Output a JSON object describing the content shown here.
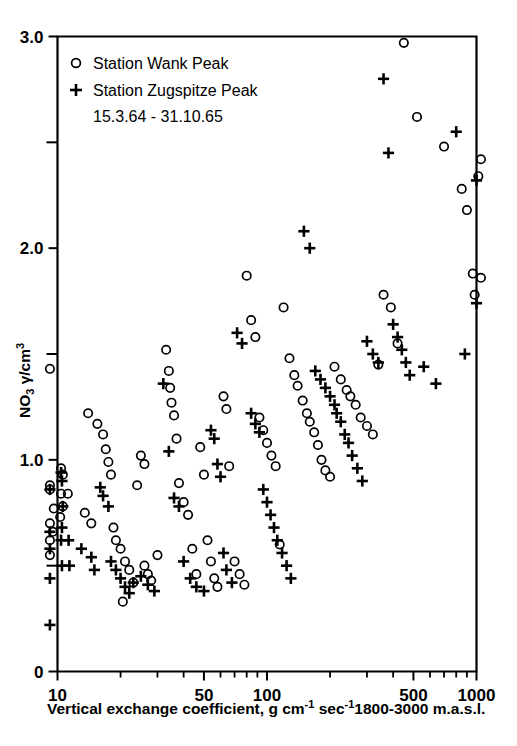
{
  "figure": {
    "background_color": "#ffffff",
    "ink_color": "#000000"
  },
  "chart_data": {
    "type": "scatter",
    "title": "",
    "xlabel": "Vertical exchange coefficient, g cm⁻¹ sec⁻¹ 1800-3000 m.a.s.l.",
    "ylabel": "NO₃ γ/cm³",
    "xscale": "log",
    "yscale": "linear",
    "xlim": [
      9.0,
      1150
    ],
    "ylim": [
      0,
      3.0
    ],
    "grid": false,
    "legend_position": "top-left",
    "xticks": [
      10,
      50,
      100,
      500,
      1000
    ],
    "xtick_labels": [
      "10",
      "50",
      "100",
      "500",
      "1000"
    ],
    "xticks_minor": [
      20,
      30,
      40,
      60,
      70,
      80,
      90,
      200,
      300,
      400,
      600,
      700,
      800,
      900
    ],
    "yticks": [
      0,
      1.0,
      2.0,
      3.0
    ],
    "ytick_labels": [
      "0",
      "1.0",
      "2.0",
      "3.0"
    ],
    "yticks_minor": [
      0.5,
      1.5,
      2.5
    ],
    "annotation": "15.3.64 - 31.10.65",
    "series": [
      {
        "name": "Station Wank Peak",
        "marker": "circle",
        "legend_label": "Station Wank Peak",
        "points": [
          [
            9.2,
            1.43
          ],
          [
            9.2,
            0.88
          ],
          [
            9.2,
            0.86
          ],
          [
            9.2,
            0.7
          ],
          [
            9.2,
            0.62
          ],
          [
            9.2,
            0.55
          ],
          [
            10.4,
            0.96
          ],
          [
            10.6,
            0.93
          ],
          [
            10.4,
            0.84
          ],
          [
            11.2,
            0.84
          ],
          [
            10.6,
            0.78
          ],
          [
            10.3,
            0.73
          ],
          [
            9.6,
            0.77
          ],
          [
            9.5,
            0.66
          ],
          [
            13.5,
            0.75
          ],
          [
            14.0,
            1.22
          ],
          [
            14.5,
            0.7
          ],
          [
            15.5,
            1.17
          ],
          [
            16.5,
            1.12
          ],
          [
            17.0,
            1.05
          ],
          [
            17.5,
            0.99
          ],
          [
            18.0,
            0.93
          ],
          [
            18.5,
            0.68
          ],
          [
            19.0,
            0.62
          ],
          [
            20.0,
            0.58
          ],
          [
            21.0,
            0.52
          ],
          [
            22.0,
            0.48
          ],
          [
            23.0,
            0.42
          ],
          [
            20.5,
            0.33
          ],
          [
            26.0,
            0.5
          ],
          [
            27.0,
            0.46
          ],
          [
            28.0,
            0.43
          ],
          [
            30.0,
            0.55
          ],
          [
            24.0,
            0.88
          ],
          [
            25.0,
            1.02
          ],
          [
            26.0,
            0.98
          ],
          [
            33.0,
            1.52
          ],
          [
            34.0,
            1.42
          ],
          [
            34.5,
            1.34
          ],
          [
            35.0,
            1.27
          ],
          [
            36.0,
            1.21
          ],
          [
            37.0,
            1.1
          ],
          [
            38.0,
            0.89
          ],
          [
            40.0,
            0.8
          ],
          [
            42.0,
            0.74
          ],
          [
            44.0,
            0.58
          ],
          [
            46.0,
            0.46
          ],
          [
            48.0,
            1.06
          ],
          [
            50.0,
            0.93
          ],
          [
            52.0,
            0.62
          ],
          [
            54.0,
            0.52
          ],
          [
            56.0,
            0.44
          ],
          [
            58.0,
            0.4
          ],
          [
            62.0,
            1.3
          ],
          [
            64.0,
            1.24
          ],
          [
            66.0,
            0.97
          ],
          [
            70.0,
            0.52
          ],
          [
            74.0,
            0.46
          ],
          [
            78.0,
            0.41
          ],
          [
            80.0,
            1.87
          ],
          [
            84.0,
            1.66
          ],
          [
            88.0,
            1.58
          ],
          [
            92.0,
            1.2
          ],
          [
            96.0,
            1.14
          ],
          [
            100.0,
            1.08
          ],
          [
            105.0,
            1.02
          ],
          [
            110.0,
            0.97
          ],
          [
            115.0,
            0.6
          ],
          [
            120.0,
            1.72
          ],
          [
            128.0,
            1.48
          ],
          [
            135.0,
            1.4
          ],
          [
            140.0,
            1.35
          ],
          [
            148.0,
            1.28
          ],
          [
            155.0,
            1.22
          ],
          [
            160.0,
            1.18
          ],
          [
            168.0,
            1.13
          ],
          [
            175.0,
            1.07
          ],
          [
            182.0,
            1.0
          ],
          [
            190.0,
            0.95
          ],
          [
            200.0,
            0.92
          ],
          [
            210.0,
            1.44
          ],
          [
            225.0,
            1.38
          ],
          [
            240.0,
            1.33
          ],
          [
            250.0,
            1.3
          ],
          [
            265.0,
            1.26
          ],
          [
            280.0,
            1.2
          ],
          [
            300.0,
            1.16
          ],
          [
            320.0,
            1.12
          ],
          [
            340.0,
            1.45
          ],
          [
            360.0,
            1.78
          ],
          [
            390.0,
            1.72
          ],
          [
            420.0,
            1.55
          ],
          [
            450.0,
            2.97
          ],
          [
            520.0,
            2.62
          ],
          [
            700.0,
            2.48
          ],
          [
            850.0,
            2.28
          ],
          [
            900.0,
            2.18
          ],
          [
            960.0,
            1.88
          ],
          [
            980.0,
            1.78
          ],
          [
            1050.0,
            2.42
          ],
          [
            1050.0,
            1.86
          ],
          [
            1020.0,
            2.34
          ]
        ]
      },
      {
        "name": "Station Zugspitze Peak",
        "marker": "plus",
        "legend_label": "Station Zugspitze Peak",
        "points": [
          [
            9.2,
            0.86
          ],
          [
            9.2,
            0.66
          ],
          [
            9.2,
            0.58
          ],
          [
            9.2,
            0.44
          ],
          [
            9.2,
            0.22
          ],
          [
            10.4,
            0.94
          ],
          [
            10.5,
            0.9
          ],
          [
            10.6,
            0.78
          ],
          [
            10.5,
            0.68
          ],
          [
            10.4,
            0.62
          ],
          [
            11.3,
            0.62
          ],
          [
            10.5,
            0.5
          ],
          [
            11.4,
            0.5
          ],
          [
            13.0,
            0.58
          ],
          [
            14.5,
            0.54
          ],
          [
            15.0,
            0.48
          ],
          [
            16.0,
            0.87
          ],
          [
            16.5,
            0.83
          ],
          [
            17.5,
            0.78
          ],
          [
            18.0,
            0.52
          ],
          [
            19.0,
            0.48
          ],
          [
            20.0,
            0.44
          ],
          [
            21.0,
            0.4
          ],
          [
            22.0,
            0.37
          ],
          [
            23.0,
            0.42
          ],
          [
            25.0,
            0.45
          ],
          [
            27.0,
            0.41
          ],
          [
            29.0,
            0.38
          ],
          [
            32.0,
            1.36
          ],
          [
            34.0,
            1.04
          ],
          [
            36.0,
            0.82
          ],
          [
            38.0,
            0.78
          ],
          [
            40.0,
            0.52
          ],
          [
            43.0,
            0.44
          ],
          [
            46.0,
            0.4
          ],
          [
            50.0,
            0.38
          ],
          [
            54.0,
            1.14
          ],
          [
            56.0,
            1.1
          ],
          [
            58.0,
            0.98
          ],
          [
            60.0,
            0.92
          ],
          [
            62.0,
            0.56
          ],
          [
            64.0,
            0.48
          ],
          [
            68.0,
            0.42
          ],
          [
            72.0,
            1.6
          ],
          [
            76.0,
            1.55
          ],
          [
            84.0,
            1.22
          ],
          [
            88.0,
            1.17
          ],
          [
            92.0,
            1.13
          ],
          [
            96.0,
            0.86
          ],
          [
            100.0,
            0.8
          ],
          [
            104.0,
            0.74
          ],
          [
            108.0,
            0.68
          ],
          [
            112.0,
            0.62
          ],
          [
            118.0,
            0.56
          ],
          [
            124.0,
            0.5
          ],
          [
            130.0,
            0.44
          ],
          [
            150.0,
            2.08
          ],
          [
            160.0,
            2.0
          ],
          [
            170.0,
            1.42
          ],
          [
            180.0,
            1.38
          ],
          [
            190.0,
            1.34
          ],
          [
            200.0,
            1.3
          ],
          [
            210.0,
            1.26
          ],
          [
            215.0,
            1.22
          ],
          [
            225.0,
            1.18
          ],
          [
            235.0,
            1.12
          ],
          [
            245.0,
            1.08
          ],
          [
            255.0,
            1.02
          ],
          [
            270.0,
            0.96
          ],
          [
            285.0,
            0.9
          ],
          [
            300.0,
            1.56
          ],
          [
            320.0,
            1.5
          ],
          [
            340.0,
            1.46
          ],
          [
            360.0,
            2.8
          ],
          [
            380.0,
            2.45
          ],
          [
            400.0,
            1.64
          ],
          [
            420.0,
            1.58
          ],
          [
            440.0,
            1.52
          ],
          [
            460.0,
            1.46
          ],
          [
            480.0,
            1.4
          ],
          [
            560.0,
            1.44
          ],
          [
            640.0,
            1.36
          ],
          [
            800.0,
            2.55
          ],
          [
            880.0,
            1.5
          ],
          [
            1000.0,
            2.32
          ],
          [
            1000.0,
            1.74
          ]
        ]
      }
    ]
  },
  "legend": {
    "entries": [
      {
        "marker": "circle",
        "label": "Station Wank Peak"
      },
      {
        "marker": "plus",
        "label": "Station Zugspitze Peak"
      }
    ],
    "date_range": "15.3.64 - 31.10.65"
  },
  "axes": {
    "x_title_parts": {
      "main": "Vertical exchange coefficient, g cm",
      "exp1": "-1",
      "mid": " sec",
      "exp2": "-1",
      "tail": "1800-3000 m.a.s.l."
    },
    "y_title_parts": {
      "base": "NO",
      "subscript": "3",
      "unit": " γ/cm",
      "superscript": "3"
    }
  }
}
